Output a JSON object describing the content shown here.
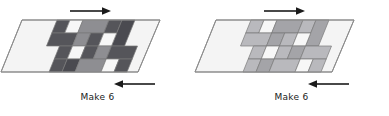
{
  "page": {
    "background": "#ffffff",
    "width": 389,
    "height": 116
  },
  "palette": {
    "outline": "#8d8d8d",
    "patch_outline": "#7a7a7a",
    "background_light": "#f4f4f4",
    "arrow": "#1b1b1b",
    "text": "#1b1b1b",
    "dark_gray": "#55555a",
    "medium_gray": "#8e8e92",
    "light_gray": "#b9b9bd",
    "white_patch": "#f7f7f7",
    "very_dark_gray": "#4a4a50",
    "mid_light_gray": "#a4a4a8"
  },
  "units": [
    {
      "id": "unit-left",
      "caption": "Make 6",
      "top_arrow": {
        "direction": "right",
        "label": "right-arrow"
      },
      "bottom_arrow": {
        "direction": "left",
        "label": "left-arrow"
      },
      "shape": "parallelogram",
      "patch_count": 24,
      "patches": [
        {
          "x": 57,
          "y": 20,
          "w": 13,
          "h": 13,
          "fill": "#55555a"
        },
        {
          "x": 70,
          "y": 20,
          "w": 13,
          "h": 13,
          "fill": "#f7f7f7"
        },
        {
          "x": 83,
          "y": 20,
          "w": 26,
          "h": 13,
          "fill": "#8e8e92"
        },
        {
          "x": 109,
          "y": 20,
          "w": 13,
          "h": 13,
          "fill": "#55555a"
        },
        {
          "x": 122,
          "y": 20,
          "w": 13,
          "h": 26,
          "fill": "#4a4a50"
        },
        {
          "x": 57,
          "y": 33,
          "w": 26,
          "h": 13,
          "fill": "#55555a"
        },
        {
          "x": 83,
          "y": 33,
          "w": 13,
          "h": 13,
          "fill": "#8e8e92"
        },
        {
          "x": 96,
          "y": 33,
          "w": 13,
          "h": 13,
          "fill": "#55555a"
        },
        {
          "x": 109,
          "y": 33,
          "w": 13,
          "h": 13,
          "fill": "#f7f7f7"
        },
        {
          "x": 70,
          "y": 46,
          "w": 13,
          "h": 13,
          "fill": "#55555a"
        },
        {
          "x": 83,
          "y": 46,
          "w": 13,
          "h": 13,
          "fill": "#f7f7f7"
        },
        {
          "x": 96,
          "y": 46,
          "w": 13,
          "h": 13,
          "fill": "#55555a"
        },
        {
          "x": 109,
          "y": 46,
          "w": 13,
          "h": 13,
          "fill": "#8e8e92"
        },
        {
          "x": 122,
          "y": 46,
          "w": 26,
          "h": 13,
          "fill": "#55555a"
        },
        {
          "x": 70,
          "y": 59,
          "w": 13,
          "h": 13,
          "fill": "#55555a"
        },
        {
          "x": 83,
          "y": 59,
          "w": 13,
          "h": 13,
          "fill": "#4a4a50"
        },
        {
          "x": 96,
          "y": 59,
          "w": 26,
          "h": 13,
          "fill": "#8e8e92"
        },
        {
          "x": 122,
          "y": 59,
          "w": 13,
          "h": 13,
          "fill": "#f7f7f7"
        },
        {
          "x": 135,
          "y": 59,
          "w": 13,
          "h": 13,
          "fill": "#55555a"
        }
      ]
    },
    {
      "id": "unit-right",
      "caption": "Make 6",
      "top_arrow": {
        "direction": "right",
        "label": "right-arrow"
      },
      "bottom_arrow": {
        "direction": "left",
        "label": "left-arrow"
      },
      "shape": "parallelogram",
      "patch_count": 22,
      "patches": [
        {
          "x": 57,
          "y": 20,
          "w": 13,
          "h": 13,
          "fill": "#b9b9bd"
        },
        {
          "x": 70,
          "y": 20,
          "w": 13,
          "h": 13,
          "fill": "#f7f7f7"
        },
        {
          "x": 83,
          "y": 20,
          "w": 26,
          "h": 13,
          "fill": "#a4a4a8"
        },
        {
          "x": 109,
          "y": 20,
          "w": 13,
          "h": 13,
          "fill": "#b9b9bd"
        },
        {
          "x": 122,
          "y": 20,
          "w": 13,
          "h": 26,
          "fill": "#a4a4a8"
        },
        {
          "x": 57,
          "y": 33,
          "w": 26,
          "h": 13,
          "fill": "#b9b9bd"
        },
        {
          "x": 83,
          "y": 33,
          "w": 13,
          "h": 13,
          "fill": "#a4a4a8"
        },
        {
          "x": 96,
          "y": 33,
          "w": 13,
          "h": 13,
          "fill": "#b9b9bd"
        },
        {
          "x": 109,
          "y": 33,
          "w": 13,
          "h": 13,
          "fill": "#f7f7f7"
        },
        {
          "x": 70,
          "y": 46,
          "w": 13,
          "h": 13,
          "fill": "#b9b9bd"
        },
        {
          "x": 83,
          "y": 46,
          "w": 13,
          "h": 13,
          "fill": "#f7f7f7"
        },
        {
          "x": 96,
          "y": 46,
          "w": 13,
          "h": 13,
          "fill": "#b9b9bd"
        },
        {
          "x": 109,
          "y": 46,
          "w": 13,
          "h": 13,
          "fill": "#a4a4a8"
        },
        {
          "x": 122,
          "y": 46,
          "w": 26,
          "h": 13,
          "fill": "#b9b9bd"
        },
        {
          "x": 70,
          "y": 59,
          "w": 13,
          "h": 13,
          "fill": "#b9b9bd"
        },
        {
          "x": 83,
          "y": 59,
          "w": 13,
          "h": 13,
          "fill": "#a4a4a8"
        },
        {
          "x": 96,
          "y": 59,
          "w": 26,
          "h": 13,
          "fill": "#b9b9bd"
        },
        {
          "x": 122,
          "y": 59,
          "w": 13,
          "h": 13,
          "fill": "#f7f7f7"
        },
        {
          "x": 135,
          "y": 59,
          "w": 13,
          "h": 13,
          "fill": "#b9b9bd"
        }
      ]
    }
  ]
}
